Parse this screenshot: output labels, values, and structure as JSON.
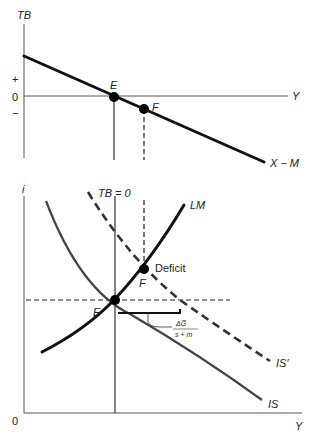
{
  "top_panel": {
    "y_axis_label": "TB",
    "x_axis_label": "Y",
    "plus_label": "+",
    "zero_label": "0",
    "minus_label": "−",
    "curve_label": "X − M",
    "point_e_label": "E",
    "point_f_label": "F"
  },
  "bottom_panel": {
    "y_axis_label": "i",
    "x_axis_label": "Y",
    "origin_label": "0",
    "tb_line_label": "TB = 0",
    "lm_label": "LM",
    "is_label": "IS",
    "is_prime_label": "IS′",
    "point_e_label": "E",
    "point_f_label": "F",
    "deficit_label": "Deficit",
    "multiplier_numerator": "ΔG̅",
    "multiplier_denominator": "s + m"
  },
  "colors": {
    "thick_curve": "#111111",
    "is_curve": "#444444",
    "axis": "#555555"
  }
}
